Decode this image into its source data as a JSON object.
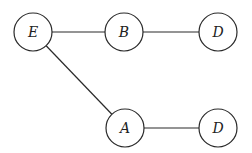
{
  "diagram": {
    "type": "graph",
    "nodes": [
      {
        "id": "n1",
        "label": "E",
        "cx": 33,
        "cy": 32
      },
      {
        "id": "n2",
        "label": "B",
        "cx": 124,
        "cy": 32
      },
      {
        "id": "n3",
        "label": "D",
        "cx": 218,
        "cy": 32
      },
      {
        "id": "n4",
        "label": "A",
        "cx": 125,
        "cy": 128
      },
      {
        "id": "n5",
        "label": "D",
        "cx": 218,
        "cy": 128
      }
    ],
    "edges": [
      {
        "from": "n1",
        "to": "n2"
      },
      {
        "from": "n2",
        "to": "n3"
      },
      {
        "from": "n1",
        "to": "n4"
      },
      {
        "from": "n4",
        "to": "n5"
      }
    ],
    "node_radius": 19
  }
}
